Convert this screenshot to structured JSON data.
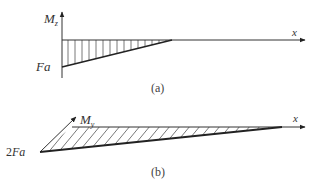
{
  "diagrams": [
    {
      "id": "a",
      "caption": "(a)",
      "vertical_axis_label": "M",
      "vertical_axis_subscript": "z",
      "horizontal_axis_label": "x",
      "value_label": "Fa",
      "hatch": "vertical",
      "shape": "triangle below axis, max Fa at origin decreasing linearly to zero"
    },
    {
      "id": "b",
      "caption": "(b)",
      "vertical_axis_label": "M",
      "vertical_axis_subscript": "y",
      "horizontal_axis_label": "x",
      "value_label": "2Fa",
      "hatch": "diagonal",
      "shape": "triangle below axis (oblique projection), max 2Fa at origin decreasing linearly to zero"
    }
  ],
  "colors": {
    "line": "#333333",
    "hatch": "#555555",
    "text": "#333333"
  }
}
